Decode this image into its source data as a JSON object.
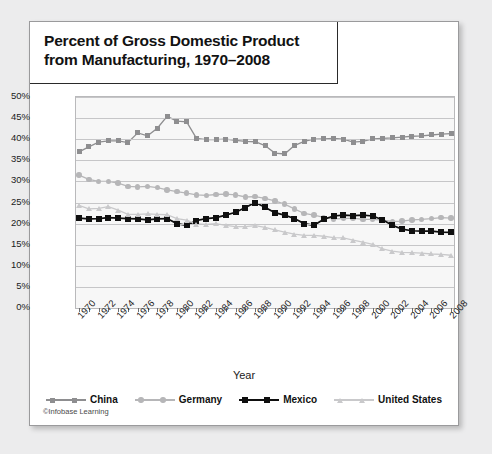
{
  "card": {
    "title_line1": "Percent of Gross Domestic Product",
    "title_line2": "from Manufacturing, 1970–2008",
    "credit": "©Infobase Learning"
  },
  "chart_data": {
    "type": "line",
    "title": "Percent of Gross Domestic Product from Manufacturing, 1970–2008",
    "xlabel": "Year",
    "ylabel": "",
    "ylim": [
      0,
      50
    ],
    "ytick_labels": [
      "0%",
      "5%",
      "10%",
      "15%",
      "20%",
      "25%",
      "30%",
      "35%",
      "40%",
      "45%",
      "50%"
    ],
    "ytick_values": [
      0,
      5,
      10,
      15,
      20,
      25,
      30,
      35,
      40,
      45,
      50
    ],
    "grid": true,
    "legend_position": "bottom",
    "x": [
      1970,
      1971,
      1972,
      1973,
      1974,
      1975,
      1976,
      1977,
      1978,
      1979,
      1980,
      1981,
      1982,
      1983,
      1984,
      1985,
      1986,
      1987,
      1988,
      1989,
      1990,
      1991,
      1992,
      1993,
      1994,
      1995,
      1996,
      1997,
      1998,
      1999,
      2000,
      2001,
      2002,
      2003,
      2004,
      2005,
      2006,
      2007,
      2008
    ],
    "xtick_labels": [
      "1970",
      "1972",
      "1974",
      "1976",
      "1978",
      "1980",
      "1982",
      "1984",
      "1986",
      "1988",
      "1990",
      "1992",
      "1994",
      "1996",
      "1998",
      "2000",
      "2002",
      "2004",
      "2006",
      "2008"
    ],
    "series": [
      {
        "name": "China",
        "color": "#8e8e90",
        "marker": "square",
        "values": [
          37.0,
          38.2,
          39.3,
          39.6,
          39.6,
          39.2,
          41.5,
          40.8,
          42.6,
          45.4,
          44.3,
          44.1,
          40.2,
          39.9,
          39.9,
          40.0,
          39.7,
          39.5,
          39.4,
          38.5,
          36.7,
          36.5,
          38.5,
          39.5,
          40.0,
          40.1,
          40.2,
          40.0,
          39.3,
          39.5,
          40.1,
          40.2,
          40.3,
          40.5,
          40.7,
          40.8,
          41.0,
          41.2,
          41.3
        ]
      },
      {
        "name": "Germany",
        "color": "#b6b6b8",
        "marker": "circle",
        "values": [
          31.5,
          30.5,
          30.0,
          30.0,
          29.6,
          28.8,
          28.7,
          28.8,
          28.5,
          28.0,
          27.6,
          27.2,
          26.8,
          26.7,
          26.9,
          27.0,
          26.8,
          26.3,
          26.4,
          26.0,
          25.4,
          24.6,
          23.5,
          22.4,
          22.0,
          21.5,
          21.1,
          21.2,
          21.3,
          21.0,
          21.0,
          20.8,
          20.5,
          20.6,
          20.9,
          21.0,
          21.2,
          21.4,
          21.3
        ]
      },
      {
        "name": "Mexico",
        "color": "#0f0f0f",
        "marker": "square",
        "values": [
          21.3,
          21.1,
          21.2,
          21.4,
          21.3,
          21.2,
          21.1,
          20.9,
          21.1,
          21.2,
          20.0,
          19.6,
          20.7,
          21.2,
          21.4,
          22.0,
          22.7,
          23.8,
          25.0,
          23.9,
          22.6,
          22.0,
          21.2,
          20.0,
          19.6,
          21.0,
          21.8,
          22.0,
          21.9,
          22.0,
          21.8,
          20.9,
          19.6,
          18.7,
          18.3,
          18.2,
          18.2,
          18.0,
          17.9
        ]
      },
      {
        "name": "United States",
        "color": "#c9c9cb",
        "marker": "triangle",
        "values": [
          24.3,
          23.5,
          23.6,
          24.0,
          23.2,
          22.2,
          22.2,
          22.3,
          22.2,
          22.1,
          21.2,
          20.8,
          19.9,
          19.8,
          20.0,
          19.6,
          19.3,
          19.3,
          19.5,
          19.1,
          18.5,
          18.0,
          17.5,
          17.2,
          17.2,
          17.0,
          16.7,
          16.6,
          16.1,
          15.6,
          15.1,
          14.0,
          13.5,
          13.2,
          13.1,
          13.0,
          12.8,
          12.7,
          12.5
        ]
      }
    ]
  }
}
